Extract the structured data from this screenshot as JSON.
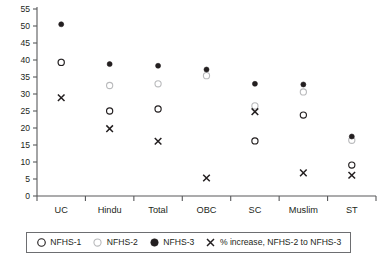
{
  "chart_data": {
    "type": "scatter",
    "title": "",
    "subtitle": "",
    "xlabel": "",
    "ylabel": "",
    "categories": [
      "UC",
      "Hindu",
      "Total",
      "OBC",
      "SC",
      "Muslim",
      "ST"
    ],
    "ylim": [
      0,
      55
    ],
    "ytick_labels": [
      "0",
      "5",
      "10",
      "15",
      "20",
      "25",
      "30",
      "35",
      "40",
      "45",
      "50",
      "55"
    ],
    "ytick_values": [
      0,
      5,
      10,
      15,
      20,
      25,
      30,
      35,
      40,
      45,
      50,
      55
    ],
    "grid": false,
    "legend_position": "bottom",
    "series": [
      {
        "name": "NFHS-1",
        "marker": "open-circle-dark",
        "color": "#231f20",
        "values": [
          39.3,
          25.0,
          25.6,
          null,
          16.2,
          23.8,
          9.1
        ]
      },
      {
        "name": "NFHS-2",
        "marker": "open-circle-light",
        "color": "#b9babc",
        "values": [
          39.4,
          32.5,
          33.0,
          35.4,
          26.5,
          30.6,
          16.4
        ]
      },
      {
        "name": "NFHS-3",
        "marker": "filled-circle",
        "color": "#231f20",
        "values": [
          50.5,
          38.8,
          38.3,
          37.2,
          33.0,
          32.8,
          17.5
        ]
      },
      {
        "name": "% increase, NFHS-2 to NFHS-3",
        "marker": "x-cross",
        "color": "#231f20",
        "values": [
          28.9,
          19.8,
          16.1,
          5.3,
          24.8,
          6.8,
          6.1
        ]
      }
    ]
  },
  "legend": {
    "entries": [
      {
        "label": "NFHS-1",
        "icon": "open-circle-dark-icon"
      },
      {
        "label": "NFHS-2",
        "icon": "open-circle-light-icon"
      },
      {
        "label": "NFHS-3",
        "icon": "filled-circle-icon"
      },
      {
        "label": "% increase, NFHS-2 to NFHS-3",
        "icon": "x-cross-icon"
      }
    ]
  },
  "colors": {
    "axis": "#58595b",
    "text": "#231f20",
    "nfhs1": "#231f20",
    "nfhs2": "#b9babc",
    "nfhs3": "#231f20",
    "increase": "#231f20",
    "legend_border": "#6d6e71",
    "background": "#ffffff"
  }
}
